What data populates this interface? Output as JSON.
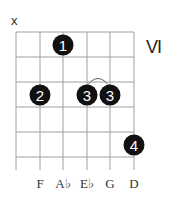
{
  "chord": {
    "muted_marker": "x",
    "position_label": "VI",
    "strings": 6,
    "frets": 5,
    "fingers": [
      {
        "finger": "1",
        "string": 3,
        "fret": 1
      },
      {
        "finger": "2",
        "string": 2,
        "fret": 3
      },
      {
        "finger": "3",
        "string": 4,
        "fret": 3
      },
      {
        "finger": "3",
        "string": 5,
        "fret": 3
      },
      {
        "finger": "4",
        "string": 6,
        "fret": 5
      }
    ],
    "tie": {
      "from_string": 4,
      "to_string": 5,
      "fret": 3
    },
    "notes": [
      "",
      "F",
      "A♭",
      "E♭",
      "G",
      "D"
    ]
  },
  "colors": {
    "grid": "#9a9a9a",
    "dot": "#111111",
    "dot_text": "#ffffff"
  }
}
